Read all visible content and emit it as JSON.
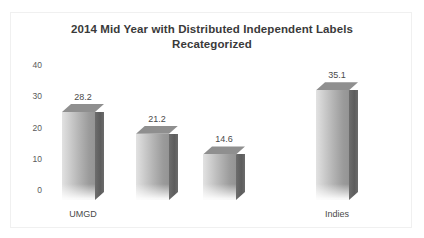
{
  "chart_data": {
    "type": "bar",
    "title": "2014 Mid Year with Distributed Independent Labels Recategorized",
    "title_lines": [
      "2014 Mid Year with Distributed Independent Labels",
      "Recategorized"
    ],
    "categories": [
      "UMGD",
      "",
      "",
      "Indies"
    ],
    "values": [
      28.2,
      21.2,
      14.6,
      35.1
    ],
    "data_labels": [
      "28.2",
      "21.2",
      "14.6",
      "35.1"
    ],
    "xlabel": "",
    "ylabel": "",
    "ylim": [
      0,
      40
    ],
    "yticks": [
      0,
      10,
      20,
      30,
      40
    ],
    "ytick_labels": [
      "0",
      "10",
      "20",
      "30",
      "40"
    ],
    "grid": false,
    "legend": false,
    "style": "3d-column",
    "colors": {
      "bar_front_light": "#e2e2e2",
      "bar_front_dark": "#949494",
      "bar_side": "#5d5d5d",
      "bar_top": "#8f8f8f",
      "title_text": "#3a3a3a",
      "axis_text": "#5a5a5a",
      "background": "#ffffff",
      "frame": "#f0f0f0"
    }
  }
}
